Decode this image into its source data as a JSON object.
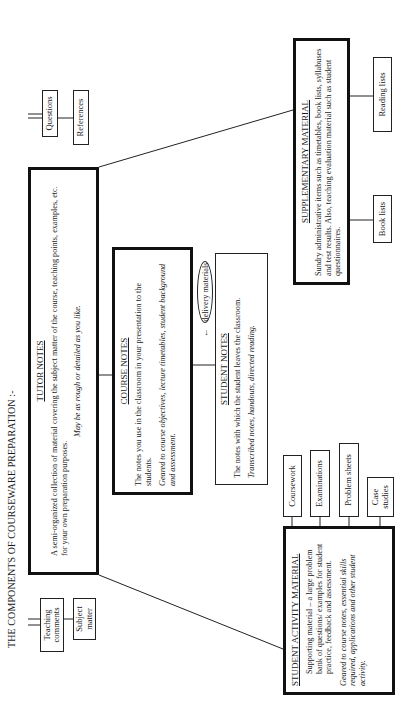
{
  "title": "THE COMPONENTS OF COURSEWARE PREPARATION :-",
  "tutor_notes": {
    "heading": "TUTOR NOTES",
    "body": "A semi-organized collection of material covering the subject matter of the course, teaching points, examples, etc. for your own preparation purposes.",
    "note": "May be as rough or detailed as you like.",
    "attachments": [
      "Teaching comments",
      "Subject matter",
      "Questions",
      "References"
    ]
  },
  "course_notes": {
    "heading": "COURSE NOTES",
    "body": "The notes you use in the classroom in your presentation to the students.",
    "note": "Geared to course objectives, lecture timetables, student background and assessment."
  },
  "delivery": {
    "arrow": "←",
    "label": "delivery materials"
  },
  "student_notes": {
    "heading": "STUDENT NOTES",
    "body": "The notes with which the student leaves the classroom.",
    "note": "Transcribed notes, handouts, directed reading."
  },
  "supplementary_material": {
    "heading": "SUPPLEMENTARY MATERIAL",
    "body": "Sundry administrative items such as timetables, book lists, syllabuses and test results.  Also, teaching evaluation material such as student questionnaires.",
    "attachments": [
      "Book lists",
      "Reading lists"
    ]
  },
  "student_activity_material": {
    "heading": "STUDENT ACTIVITY MATERIAL",
    "body": "Supporting material – a large problem bank of questions/ examples for student practice, feedback and assessment.",
    "note": "Geared to course notes, essential skills required, applications and other student activity.",
    "attachments": [
      "Coursework",
      "Examinations",
      "Problem sheets",
      "Case studies"
    ]
  }
}
